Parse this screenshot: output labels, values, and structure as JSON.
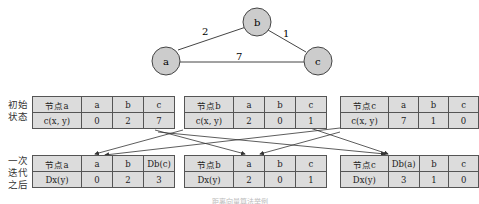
{
  "graph": {
    "nodes": [
      {
        "id": "a",
        "label": "a"
      },
      {
        "id": "b",
        "label": "b"
      },
      {
        "id": "c",
        "label": "c"
      }
    ],
    "edges": [
      {
        "from": "a",
        "to": "b",
        "weight": "2"
      },
      {
        "from": "b",
        "to": "c",
        "weight": "1"
      },
      {
        "from": "a",
        "to": "c",
        "weight": "7"
      }
    ],
    "node_color": "#cccccc"
  },
  "row_labels": {
    "initial": "初始状态",
    "initial_line1": "初始",
    "initial_line2": "状态",
    "after": "一次迭代之后",
    "after_line1": "一次",
    "after_line2": "迭代",
    "after_line3": "之后"
  },
  "initial_tables": [
    {
      "header": "节点a",
      "cols": [
        "a",
        "b",
        "c"
      ],
      "row_label": "c(x, y)",
      "values": [
        "0",
        "2",
        "7"
      ]
    },
    {
      "header": "节点b",
      "cols": [
        "a",
        "b",
        "c"
      ],
      "row_label": "c(x, y)",
      "values": [
        "2",
        "0",
        "1"
      ]
    },
    {
      "header": "节点c",
      "cols": [
        "a",
        "b",
        "c"
      ],
      "row_label": "c(x, y)",
      "values": [
        "7",
        "1",
        "0"
      ]
    }
  ],
  "after_tables": [
    {
      "header": "节点a",
      "cols": [
        "a",
        "b",
        "Db(c)"
      ],
      "row_label": "Dx(y)",
      "values": [
        "0",
        "2",
        "3"
      ]
    },
    {
      "header": "节点b",
      "cols": [
        "a",
        "b",
        "c"
      ],
      "row_label": "Dx(y)",
      "values": [
        "2",
        "0",
        "1"
      ]
    },
    {
      "header": "节点c",
      "cols": [
        "Db(a)",
        "b",
        "c"
      ],
      "row_label": "Dx(y)",
      "values": [
        "3",
        "1",
        "0"
      ]
    }
  ],
  "caption": "距离向量算法举例",
  "table_fill": "#dcdcdc"
}
